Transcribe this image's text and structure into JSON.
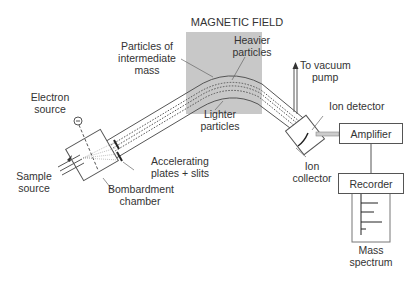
{
  "diagram": {
    "title": "MAGNETIC FIELD",
    "labels": {
      "electron_source": [
        "Electron",
        "source"
      ],
      "sample_source": [
        "Sample",
        "source"
      ],
      "bombardment_chamber": [
        "Bombardment",
        "chamber"
      ],
      "accelerating_plates": [
        "Accelerating",
        "plates + slits"
      ],
      "intermediate_mass": [
        "Particles of",
        "intermediate",
        "mass"
      ],
      "heavier_particles": [
        "Heavier",
        "particles"
      ],
      "lighter_particles": [
        "Lighter",
        "particles"
      ],
      "vacuum_pump": [
        "To vacuum",
        "pump"
      ],
      "ion_detector": [
        "Ion detector"
      ],
      "ion_collector": [
        "Ion",
        "collector"
      ],
      "mass_spectrum": [
        "Mass",
        "spectrum"
      ]
    },
    "boxes": {
      "amplifier": "Amplifier",
      "recorder": "Recorder"
    },
    "colors": {
      "magnetic_field": "#c8c8c8",
      "line": "#555555",
      "text": "#333333"
    }
  }
}
